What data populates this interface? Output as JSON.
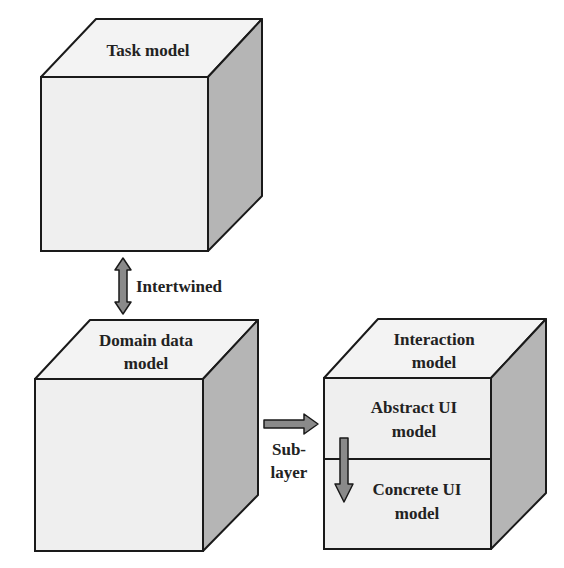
{
  "cubes": {
    "task": {
      "label_lines": [
        "Task model"
      ]
    },
    "domain": {
      "label_lines": [
        "Domain data",
        "model"
      ]
    },
    "interaction": {
      "label_lines": [
        "Interaction",
        "model"
      ],
      "layers": [
        {
          "label_lines": [
            "Abstract UI",
            "model"
          ]
        },
        {
          "label_lines": [
            "Concrete UI",
            "model"
          ]
        }
      ]
    }
  },
  "connectors": {
    "intertwined": {
      "label": "Intertwined",
      "direction": "bidirectional-vertical"
    },
    "sublayer": {
      "label_lines": [
        "Sub-",
        "layer"
      ],
      "direction": "right"
    },
    "layer_flow": {
      "direction": "down"
    }
  },
  "colors": {
    "top_face": "#f3f3f3",
    "front_face": "#efefef",
    "side_face": "#b5b5b5",
    "outline": "#1a1a1a",
    "arrow_fill": "#8a8a8a",
    "text": "#222222"
  }
}
